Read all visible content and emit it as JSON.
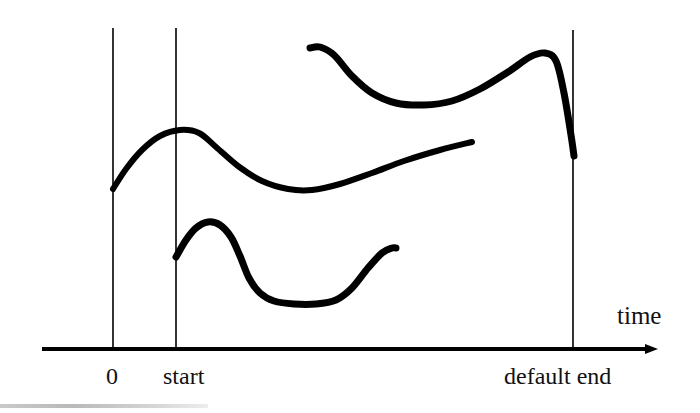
{
  "figure": {
    "background_color": "#ffffff",
    "stroke_color": "#000000",
    "width": 700,
    "height": 413
  },
  "axis": {
    "name": "time-axis",
    "label": "time",
    "orientation": "horizontal",
    "arrow": true,
    "start_x": 42,
    "end_x": 660,
    "y": 349,
    "line_width": 4
  },
  "ticks": [
    {
      "id": "zero",
      "label": "0",
      "x": 113,
      "line_top": 28,
      "line_bottom": 349
    },
    {
      "id": "start",
      "label": "start",
      "x": 176,
      "line_top": 28,
      "line_bottom": 349
    },
    {
      "id": "default-end",
      "label": "default end",
      "x": 573,
      "line_top": 30,
      "line_bottom": 349
    }
  ],
  "curves": [
    {
      "id": "upper-curve",
      "name": "upper-curve",
      "description": "starts after start marker, dips, rises to a peak then drops sharply at default end",
      "stroke_width": 7,
      "points": [
        [
          310,
          48
        ],
        [
          320,
          47
        ],
        [
          334,
          55
        ],
        [
          352,
          76
        ],
        [
          372,
          93
        ],
        [
          396,
          103
        ],
        [
          424,
          105
        ],
        [
          452,
          101
        ],
        [
          480,
          89
        ],
        [
          508,
          72
        ],
        [
          530,
          57
        ],
        [
          545,
          53
        ],
        [
          556,
          61
        ],
        [
          564,
          93
        ],
        [
          571,
          135
        ],
        [
          574,
          156
        ]
      ]
    },
    {
      "id": "middle-curve",
      "name": "middle-curve",
      "description": "rises from the zero marker, peaks just past start, descends to a trough then climbs steadily",
      "stroke_width": 6,
      "points": [
        [
          113,
          189
        ],
        [
          126,
          169
        ],
        [
          142,
          150
        ],
        [
          160,
          136
        ],
        [
          180,
          130
        ],
        [
          199,
          133
        ],
        [
          216,
          147
        ],
        [
          238,
          166
        ],
        [
          262,
          181
        ],
        [
          288,
          189
        ],
        [
          312,
          190
        ],
        [
          340,
          184
        ],
        [
          372,
          173
        ],
        [
          404,
          161
        ],
        [
          440,
          150
        ],
        [
          472,
          142
        ]
      ]
    },
    {
      "id": "lower-curve",
      "name": "lower-curve",
      "description": "starts at the start marker, small hump, falls to a long trough then rises and flattens",
      "stroke_width": 7,
      "points": [
        [
          176,
          257
        ],
        [
          186,
          240
        ],
        [
          196,
          228
        ],
        [
          208,
          222
        ],
        [
          220,
          225
        ],
        [
          231,
          237
        ],
        [
          240,
          256
        ],
        [
          249,
          278
        ],
        [
          260,
          293
        ],
        [
          274,
          301
        ],
        [
          294,
          304
        ],
        [
          316,
          304
        ],
        [
          336,
          300
        ],
        [
          352,
          288
        ],
        [
          368,
          268
        ],
        [
          382,
          253
        ],
        [
          392,
          248
        ],
        [
          396,
          248
        ]
      ]
    }
  ],
  "artifacts": [
    {
      "id": "bottom-scan-line",
      "name": "scan-artifact",
      "x": 0,
      "y": 404,
      "width": 208,
      "height": 4
    }
  ]
}
